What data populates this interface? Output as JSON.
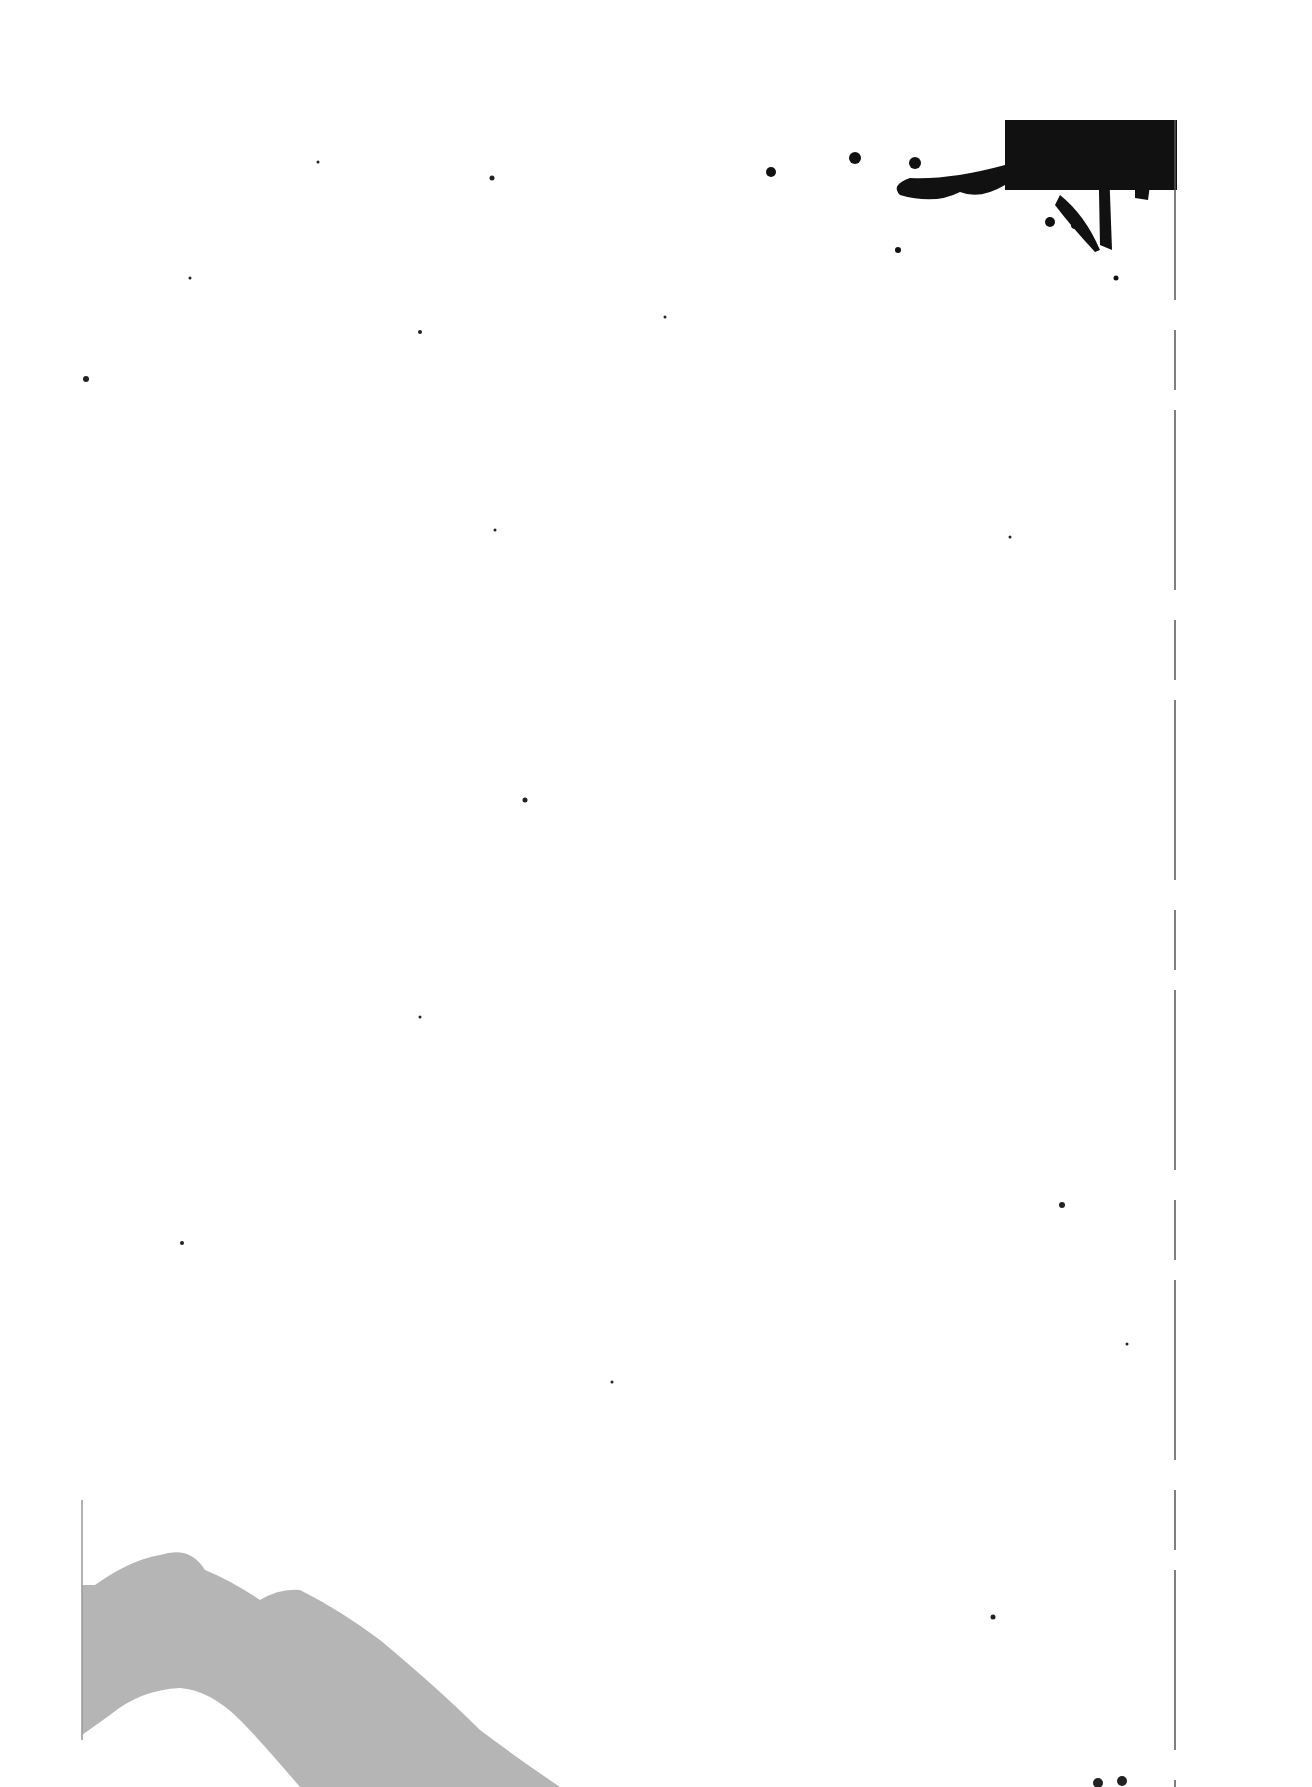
{
  "document": {
    "type": "scanned-page",
    "text": "",
    "artifacts": {
      "top_right_blot": {
        "color": "#111111"
      },
      "bottom_left_smudge": {
        "color": "#a8a8a8"
      },
      "specks": [
        [
          318,
          162
        ],
        [
          350,
          155
        ],
        [
          492,
          178
        ],
        [
          545,
          215
        ],
        [
          190,
          278
        ],
        [
          250,
          340
        ],
        [
          420,
          332
        ],
        [
          665,
          317
        ],
        [
          750,
          320
        ],
        [
          86,
          379
        ],
        [
          710,
          395
        ],
        [
          740,
          380
        ],
        [
          495,
          530
        ],
        [
          1010,
          537
        ],
        [
          195,
          650
        ],
        [
          885,
          692
        ],
        [
          525,
          800
        ],
        [
          1075,
          805
        ],
        [
          343,
          882
        ],
        [
          420,
          1017
        ],
        [
          432,
          1007
        ],
        [
          1062,
          1205
        ],
        [
          182,
          1243
        ],
        [
          1127,
          1344
        ],
        [
          612,
          1382
        ],
        [
          730,
          1353
        ],
        [
          855,
          1358
        ],
        [
          985,
          917
        ],
        [
          1165,
          1232
        ],
        [
          295,
          1512
        ],
        [
          510,
          1635
        ],
        [
          995,
          1615
        ]
      ]
    }
  }
}
